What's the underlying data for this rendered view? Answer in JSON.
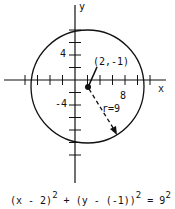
{
  "diagram": {
    "type": "circle-on-coordinate-plane",
    "axes": {
      "x_label": "x",
      "y_label": "y"
    },
    "tick_labels": {
      "y_pos": "4",
      "y_neg": "-4",
      "x_pos": "8"
    },
    "center": {
      "label": "(2,-1)",
      "x": 2,
      "y": -1
    },
    "radius": {
      "label": "r=9",
      "value": 9
    },
    "equation": {
      "left1": "(x - 2)",
      "exp1": "2",
      "plus": " + ",
      "left2": "(y - (-1))",
      "exp2": "2",
      "equals": " = ",
      "rhs": "9",
      "exp3": "2"
    }
  }
}
